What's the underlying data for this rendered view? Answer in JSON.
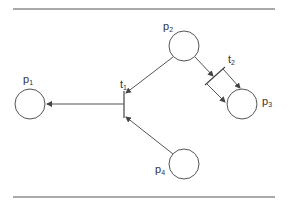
{
  "diagram": {
    "type": "petri-net",
    "places": [
      {
        "id": "p1",
        "label": "p",
        "sub": "1"
      },
      {
        "id": "p2",
        "label": "p",
        "sub": "2"
      },
      {
        "id": "p3",
        "label": "p",
        "sub": "3"
      },
      {
        "id": "p4",
        "label": "p",
        "sub": "4"
      }
    ],
    "transitions": [
      {
        "id": "t1",
        "label": "t",
        "sub": "1"
      },
      {
        "id": "t2",
        "label": "t",
        "sub": "2"
      }
    ],
    "arcs": [
      {
        "from": "p2",
        "to": "t1"
      },
      {
        "from": "p4",
        "to": "t1"
      },
      {
        "from": "t1",
        "to": "p1"
      },
      {
        "from": "p2",
        "to": "t2"
      },
      {
        "from": "t2",
        "to": "p3"
      }
    ],
    "colors": {
      "stroke": "#555555",
      "text": "#333333"
    }
  }
}
